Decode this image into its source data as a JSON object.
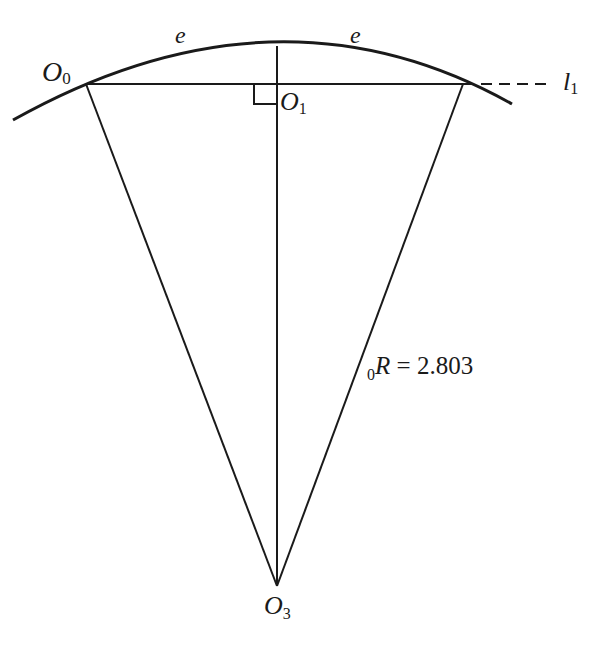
{
  "diagram": {
    "type": "geometry",
    "labels": {
      "arc_left": "e",
      "arc_right": "e",
      "point_o0": {
        "main": "O",
        "sub": "0"
      },
      "point_o1": {
        "main": "O",
        "sub": "1"
      },
      "point_o3": {
        "main": "O",
        "sub": "3"
      },
      "line_l1": {
        "main": "l",
        "sub": "1"
      },
      "radius": {
        "pre_sub": "0",
        "main": "R",
        "eq": " = 2.803"
      }
    },
    "values": {
      "radius": 2.803
    },
    "colors": {
      "stroke": "#1a1a1a",
      "background": "#ffffff"
    }
  }
}
